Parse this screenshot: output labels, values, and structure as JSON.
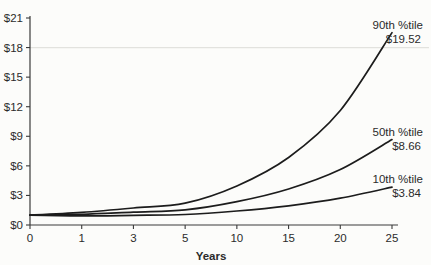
{
  "chart_data": {
    "type": "line",
    "title": "",
    "xlabel": "Years",
    "ylabel": "",
    "x_tick_labels": [
      "0",
      "1",
      "3",
      "5",
      "10",
      "15",
      "20",
      "25"
    ],
    "x_values_years": [
      0,
      1,
      3,
      5,
      10,
      15,
      20,
      25
    ],
    "y_tick_labels": [
      "$0",
      "$3",
      "$6",
      "$9",
      "$12",
      "$15",
      "$18",
      "$21"
    ],
    "y_tick_values": [
      0,
      3,
      6,
      9,
      12,
      15,
      18,
      21
    ],
    "ylim": [
      0,
      21
    ],
    "grid": "single faint line at $18 only",
    "gridline_at": 18,
    "legend_position": "end-of-line labels, right side",
    "series": [
      {
        "name": "90th %tile",
        "end_label": "$19.52",
        "values": [
          1.0,
          1.28,
          1.72,
          2.21,
          3.96,
          6.85,
          11.62,
          19.52
        ]
      },
      {
        "name": "50th %tile",
        "end_label": "$8.66",
        "values": [
          1.0,
          1.09,
          1.3,
          1.54,
          2.37,
          3.65,
          5.62,
          8.66
        ]
      },
      {
        "name": "10th %tile",
        "end_label": "$3.84",
        "values": [
          1.0,
          0.93,
          0.98,
          1.07,
          1.42,
          1.94,
          2.72,
          3.84
        ]
      }
    ],
    "colors": {
      "line": "#1c1c1c",
      "axis": "#3a3a3a",
      "grid": "#e2e2de",
      "text": "#2b2b2b",
      "background": "#fcfcfa"
    }
  }
}
